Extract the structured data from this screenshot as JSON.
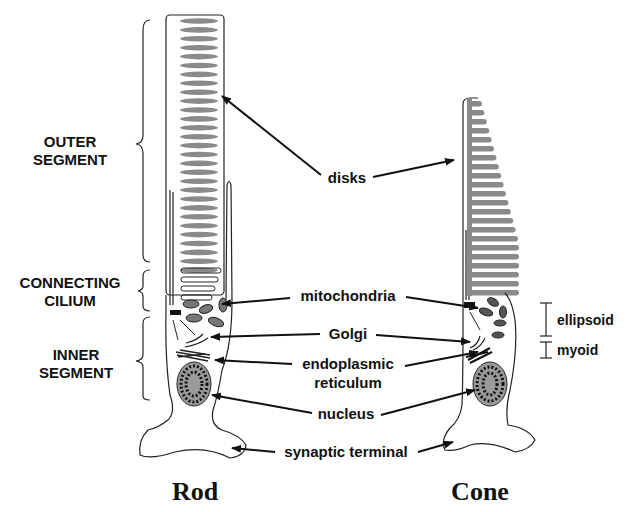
{
  "diagram": {
    "segments": {
      "outer": [
        "OUTER",
        "SEGMENT"
      ],
      "connecting": [
        "CONNECTING",
        "CILIUM"
      ],
      "inner": [
        "INNER",
        "SEGMENT"
      ]
    },
    "labels": {
      "disks": "disks",
      "mitochondria": "mitochondria",
      "golgi": "Golgi",
      "er_line1": "endoplasmic",
      "er_line2": "reticulum",
      "nucleus": "nucleus",
      "synaptic": "synaptic terminal",
      "ellipsoid": "ellipsoid",
      "myoid": "myoid"
    },
    "cells": {
      "rod": "Rod",
      "cone": "Cone"
    },
    "colors": {
      "disk_fill": "#8a8a8a",
      "nucleus_fill": "#9a9a9a",
      "line": "#111111"
    }
  }
}
